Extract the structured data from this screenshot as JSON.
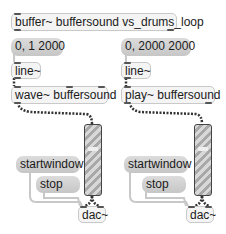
{
  "patch": {
    "buffer_object": "buffer~ buffersound vs_drums_loop",
    "left": {
      "message": "0, 1 2000",
      "line_object": "line~",
      "player_object": "wave~ buffersound",
      "start_message": "startwindow",
      "stop_message": "stop",
      "dac_object": "dac~"
    },
    "right": {
      "message": "0, 2000 2000",
      "line_object": "line~",
      "player_object": "play~ buffersound",
      "start_message": "startwindow",
      "stop_message": "stop",
      "dac_object": "dac~"
    }
  },
  "colors": {
    "background": "#ffffff",
    "message_box": "#cccccc",
    "object_box": "#f4f4f4",
    "patch_cord": "#9a9a9a",
    "signal_cord": "#333333"
  }
}
